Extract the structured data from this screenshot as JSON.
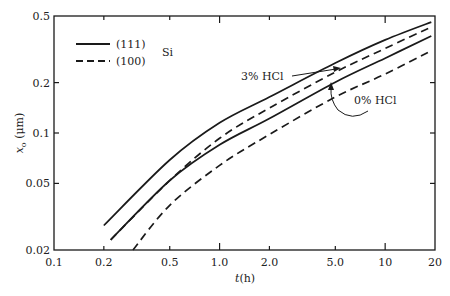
{
  "chart_data": {
    "type": "line",
    "title": "",
    "xlabel": "t(h)",
    "ylabel": "x_o (μm)",
    "xscale": "log",
    "yscale": "log",
    "xlim": [
      0.1,
      20
    ],
    "ylim": [
      0.02,
      0.5
    ],
    "grid": false,
    "x_ticks": [
      {
        "value": 0.1,
        "label": "0.1"
      },
      {
        "value": 0.2,
        "label": "0.2"
      },
      {
        "value": 0.5,
        "label": "0.5"
      },
      {
        "value": 1.0,
        "label": "1.0"
      },
      {
        "value": 2.0,
        "label": "2.0"
      },
      {
        "value": 5.0,
        "label": "5.0"
      },
      {
        "value": 10,
        "label": "10"
      },
      {
        "value": 20,
        "label": "20"
      }
    ],
    "y_ticks": [
      {
        "value": 0.02,
        "label": "0.02"
      },
      {
        "value": 0.05,
        "label": "0.05"
      },
      {
        "value": 0.1,
        "label": "0.1"
      },
      {
        "value": 0.2,
        "label": "0.2"
      },
      {
        "value": 0.5,
        "label": "0.5"
      }
    ],
    "legend": {
      "position": "upper-left",
      "group_label": "Si",
      "entries": [
        {
          "label": "(111)",
          "style": "solid"
        },
        {
          "label": "(100)",
          "style": "dashed"
        }
      ]
    },
    "series": [
      {
        "name": "(111) Si, 3% HCl",
        "style": "solid",
        "x": [
          0.2,
          0.5,
          1.0,
          2.0,
          5.0,
          10,
          19
        ],
        "y": [
          0.028,
          0.069,
          0.115,
          0.164,
          0.262,
          0.36,
          0.46
        ]
      },
      {
        "name": "(100) Si, 3% HCl",
        "style": "dashed",
        "x": [
          0.22,
          0.5,
          1.0,
          2.0,
          5.0,
          10,
          19
        ],
        "y": [
          0.023,
          0.052,
          0.093,
          0.141,
          0.231,
          0.32,
          0.43
        ]
      },
      {
        "name": "(111) Si, 0% HCl",
        "style": "solid",
        "x": [
          0.22,
          0.5,
          1.0,
          2.0,
          5.0,
          10,
          19
        ],
        "y": [
          0.023,
          0.052,
          0.085,
          0.122,
          0.201,
          0.28,
          0.38
        ]
      },
      {
        "name": "(100) Si, 0% HCl",
        "style": "dashed",
        "x": [
          0.3,
          0.5,
          1.0,
          2.0,
          5.0,
          10,
          19
        ],
        "y": [
          0.02,
          0.037,
          0.064,
          0.098,
          0.164,
          0.225,
          0.31
        ]
      }
    ],
    "annotations": [
      {
        "text": "3% HCl",
        "points_to": "upper pair of curves",
        "near_x": 5.0
      },
      {
        "text": "0% HCl",
        "points_to": "lower pair of curves",
        "near_x": 5.0
      }
    ]
  }
}
